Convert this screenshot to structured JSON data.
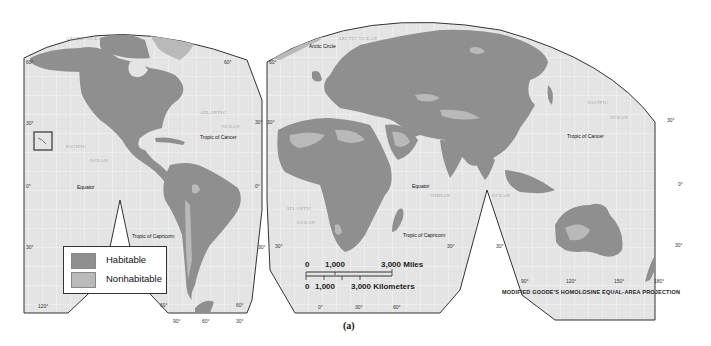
{
  "figure": {
    "caption": "(a)",
    "projection": "MODIFIED GOODE'S HOMOLOSINE EQUAL-AREA PROJECTION"
  },
  "colors": {
    "habitable": "#8f8f8f",
    "nonhabitable": "#b9b9b9",
    "ocean": "#e4e4e4",
    "graticule": "#f6f6f6",
    "frame": "#333333"
  },
  "legend": {
    "items": [
      {
        "label": "Habitable",
        "color": "#8f8f8f"
      },
      {
        "label": "Nonhabitable",
        "color": "#b9b9b9"
      }
    ]
  },
  "scale_bar": {
    "miles": {
      "zero": "0",
      "mid": "1,000",
      "max": "3,000 Miles"
    },
    "kilometers": {
      "zero": "0",
      "mid": "1,000",
      "max": "3,000 Kilometers"
    }
  },
  "labels": {
    "arctic_ocean_west": "ARCTIC OCEAN",
    "arctic_ocean_east": "ARCTIC OCEAN",
    "atlantic_ocean_north_1": "ATLANTIC",
    "atlantic_ocean_north_2": "OCEAN",
    "pacific_ocean_west_1": "PACIFIC",
    "pacific_ocean_west_2": "OCEAN",
    "pacific_ocean_east_1": "PACIFIC",
    "pacific_ocean_east_2": "OCEAN",
    "atlantic_ocean_south_1": "ATLANTIC",
    "atlantic_ocean_south_2": "OCEAN",
    "indian_ocean_1": "INDIAN",
    "indian_ocean_2": "OCEAN",
    "arctic_circle": "Arctic Circle",
    "tropic_cancer_west": "Tropic of Cancer",
    "tropic_cancer_east": "Tropic of Cancer",
    "equator_west": "Equator",
    "equator_east": "Equator",
    "tropic_capricorn_west": "Tropic of Capricorn",
    "tropic_capricorn_east": "Tropic of Capricorn"
  },
  "degree_labels": {
    "lat_60_w": "60°",
    "lat_60_e": "60°",
    "lat_30_w": "30°",
    "lat_30_mid": "30°",
    "lat_30_mid2": "30°",
    "lat_30_e": "30°",
    "lat_0_w": "0°",
    "lat_0_mid": "0°",
    "lat_0_e": "0°",
    "lat_s30_w": "30°",
    "lat_s30_mid": "30°",
    "lat_s30_mid2": "30°",
    "lat_s30_mid3": "30°",
    "lat_s30_mid4": "30°",
    "lat_s30_e": "30°",
    "lat_60n_e2": "60°",
    "lon_120w": "120°",
    "lon_90w": "90°",
    "lon_60w": "60°",
    "lon_30w": "30°",
    "lon_0": "0°",
    "lon_30e": "30°",
    "lon_60e": "60°",
    "lon_90e": "90°",
    "lon_120e": "120°",
    "lon_150e": "150°",
    "lon_180": "180°",
    "lat_60s_w": "60°",
    "lat_60s_e": "60°"
  }
}
